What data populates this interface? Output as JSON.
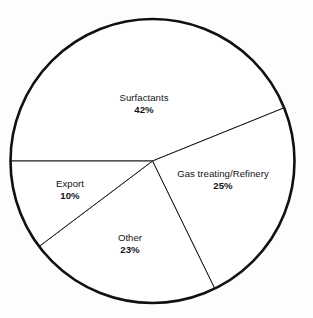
{
  "chart_data": {
    "type": "pie",
    "title": "",
    "subtitle": "",
    "xlabel": "",
    "ylabel": "",
    "legend_position": "none",
    "grid": false,
    "labels_inside": true,
    "value_suffix": "%",
    "categories": [
      "Surfactants",
      "Gas treating/Refinery",
      "Other",
      "Export"
    ],
    "values": [
      42,
      25,
      23,
      10
    ],
    "total": 100,
    "slices": [
      {
        "name": "Surfactants",
        "value": 42,
        "value_label": "42%",
        "start_angle_deg": -22,
        "end_angle_deg": -180,
        "sweep_deg": 151,
        "label_x": 144,
        "label_y": 104,
        "fill": "#ffffff"
      },
      {
        "name": "Gas treating/Refinery",
        "value": 25,
        "value_label": "25%",
        "start_angle_deg": -22,
        "end_angle_deg": 64,
        "sweep_deg": 90,
        "label_x": 223,
        "label_y": 180,
        "fill": "#ffffff"
      },
      {
        "name": "Other",
        "value": 23,
        "value_label": "23%",
        "start_angle_deg": 64,
        "end_angle_deg": 143,
        "sweep_deg": 83,
        "label_x": 130,
        "label_y": 244,
        "fill": "#ffffff"
      },
      {
        "name": "Export",
        "value": 10,
        "value_label": "10%",
        "start_angle_deg": 143,
        "end_angle_deg": 180,
        "sweep_deg": 36,
        "label_x": 70,
        "label_y": 190,
        "fill": "#ffffff"
      }
    ],
    "geometry": {
      "center_x": 152.5,
      "center_y": 161,
      "radius": 142
    },
    "colors": {
      "background": "#fdfdfd",
      "outline": "#111111",
      "divider": "#1a1a1a",
      "text": "#141414"
    }
  }
}
